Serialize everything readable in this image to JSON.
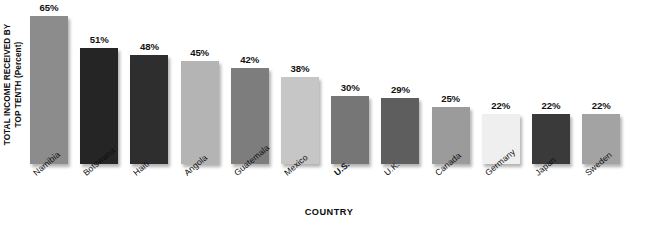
{
  "chart_data": {
    "type": "bar",
    "title": "",
    "xlabel": "COUNTRY",
    "ylabel": "TOTAL INCOME RECEIVED BY TOP TENTH",
    "ylabel_line1": "TOTAL INCOME RECEIVED BY",
    "ylabel_line2": "TOP TENTH (Percent)",
    "yunit": "(Percent)",
    "ylim": [
      0,
      72
    ],
    "grid": false,
    "legend": null,
    "categories": [
      "Namibia",
      "Botswana",
      "Haiti",
      "Angola",
      "Guatemala",
      "Mexico",
      "U.S.",
      "U.K.",
      "Canada",
      "Germany",
      "Japan",
      "Sweden"
    ],
    "values": [
      65,
      51,
      48,
      45,
      42,
      38,
      30,
      29,
      25,
      22,
      22,
      22
    ],
    "value_labels": [
      "65%",
      "51%",
      "48%",
      "45%",
      "42%",
      "38%",
      "30%",
      "29%",
      "25%",
      "22%",
      "22%",
      "22%"
    ],
    "bar_colors": [
      "#8c8c8c",
      "#252525",
      "#2e2e2e",
      "#b4b4b4",
      "#7d7d7d",
      "#c6c6c6",
      "#767676",
      "#5e5e5e",
      "#9b9b9b",
      "#efefef",
      "#3a3a3a",
      "#a3a3a3"
    ],
    "emphasized_category": "U.S."
  }
}
